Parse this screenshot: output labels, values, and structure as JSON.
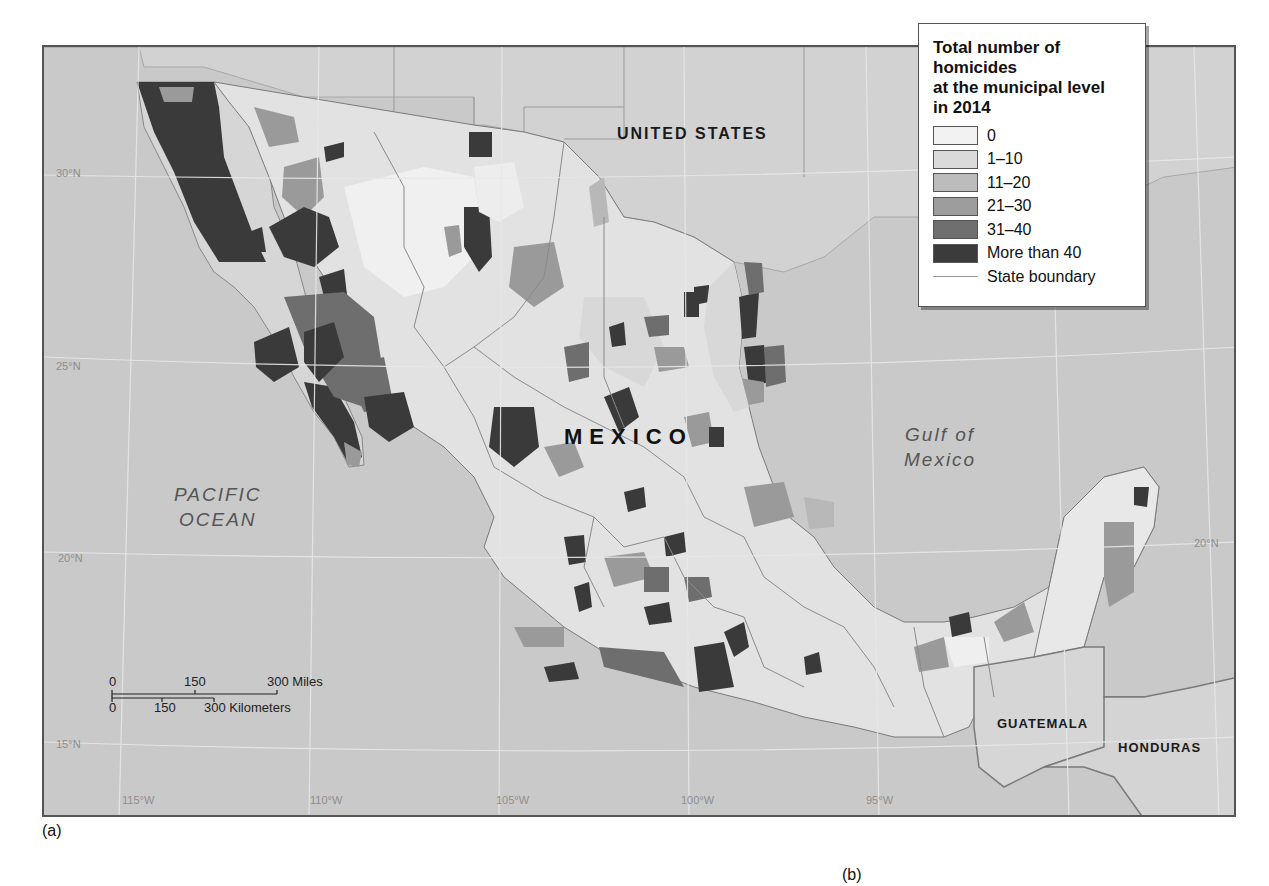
{
  "figure": {
    "caption_a": "(a)",
    "caption_b": "(b)"
  },
  "map": {
    "labels": {
      "united_states": "UNITED STATES",
      "mexico": "MEXICO",
      "guatemala": "GUATEMALA",
      "honduras": "HONDURAS",
      "pacific_ocean_line1": "PACIFIC",
      "pacific_ocean_line2": "OCEAN",
      "gulf_line1": "Gulf of",
      "gulf_line2": "Mexico"
    },
    "graticule": {
      "latitudes_left": [
        "30°N",
        "25°N",
        "20°N",
        "15°N"
      ],
      "latitudes_right": [
        "20°N"
      ],
      "longitudes": [
        "115°W",
        "110°W",
        "105°W",
        "100°W",
        "95°W"
      ]
    },
    "scale_bar": {
      "miles": {
        "ticks": [
          "0",
          "150",
          "300 Miles"
        ]
      },
      "kilometers": {
        "ticks": [
          "0",
          "150",
          "300 Kilometers"
        ]
      }
    },
    "colors": {
      "ocean": "#c9c9c9",
      "land_other": "#d3d3d3",
      "class_0": "#efefef",
      "class_1_10": "#d9d9d9",
      "class_11_20": "#b8b8b8",
      "class_21_30": "#9a9a9a",
      "class_31_40": "#6e6e6e",
      "class_over_40": "#3a3a3a",
      "state_boundary": "#8a8a8a"
    }
  },
  "legend": {
    "title_line1": "Total number of homicides",
    "title_line2": "at the municipal level",
    "title_line3": "in 2014",
    "items": [
      {
        "label": "0",
        "color": "#f2f2f2"
      },
      {
        "label": "1–10",
        "color": "#dadada"
      },
      {
        "label": "11–20",
        "color": "#bcbcbc"
      },
      {
        "label": "21–30",
        "color": "#9d9d9d"
      },
      {
        "label": "31–40",
        "color": "#6f6f6f"
      },
      {
        "label": "More than 40",
        "color": "#3b3b3b"
      }
    ],
    "line_item": {
      "label": "State boundary"
    }
  }
}
